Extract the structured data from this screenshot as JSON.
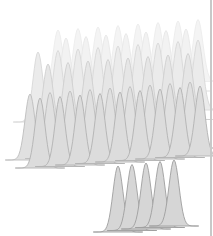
{
  "illustration": {
    "subject": "layered grid of bell curves (normal distributions)",
    "background": "#ffffff",
    "edge_line_color": "#c8c8c8",
    "curve_width": 26,
    "rows": [
      {
        "y_base": 92,
        "x_start": 58,
        "count": 8,
        "spacing": 20,
        "height": 62,
        "fill": "#f4f4f4",
        "stroke": "#ececec",
        "dx": 0
      },
      {
        "y_base": 100,
        "x_start": 66,
        "count": 7,
        "spacing": 20,
        "height": 62,
        "fill": "#f2f2f2",
        "stroke": "#e8e8e8",
        "dx": 0
      },
      {
        "y_base": 122,
        "x_start": 38,
        "count": 9,
        "spacing": 20,
        "height": 70,
        "fill": "#ebebeb",
        "stroke": "#d8d8d8",
        "dx": 0
      },
      {
        "y_base": 130,
        "x_start": 48,
        "count": 8,
        "spacing": 20,
        "height": 66,
        "fill": "#e6e6e6",
        "stroke": "#cfcfcf",
        "dx": 0
      },
      {
        "y_base": 160,
        "x_start": 30,
        "count": 9,
        "spacing": 20,
        "height": 66,
        "fill": "#e0e0e0",
        "stroke": "#bdbdbd",
        "dx": 0
      },
      {
        "y_base": 168,
        "x_start": 40,
        "count": 9,
        "spacing": 20,
        "height": 70,
        "fill": "#dcdcdc",
        "stroke": "#b2b2b2",
        "dx": 0
      },
      {
        "y_base": 232,
        "x_start": 118,
        "count": 5,
        "spacing": 14,
        "height": 66,
        "fill": "#d6d6d6",
        "stroke": "#9e9e9e",
        "dx": 0
      }
    ]
  }
}
